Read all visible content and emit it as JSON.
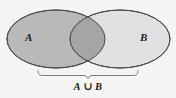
{
  "figure": {
    "kind": "venn-diagram",
    "background_color": "#f6f5f3",
    "outline_color": "#4a4a4a"
  },
  "sets": [
    {
      "id": "A",
      "label": "A",
      "fill_color": "#b9b9b7",
      "cx": 56,
      "cy": 39,
      "rx": 49,
      "ry": 29
    },
    {
      "id": "B",
      "label": "B",
      "fill_color": "#dedede",
      "cx": 120,
      "cy": 39,
      "rx": 50,
      "ry": 29
    }
  ],
  "intersection": {
    "fill_color": "#a5a5a3"
  },
  "brace": {
    "label_left": "A",
    "operator": "∪",
    "label_right": "B",
    "caption_text": "A ∪ B",
    "color": "#6b6b6b",
    "x_start": 38,
    "x_end": 138,
    "y": 70
  }
}
